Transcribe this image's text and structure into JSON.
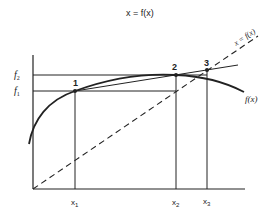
{
  "title": "x = f(x)",
  "labels": {
    "y_f2": "f",
    "y_f2_sub": "2",
    "y_f1": "f",
    "y_f1_sub": "1",
    "point1": "1",
    "point2": "2",
    "point3": "3",
    "curve": "f(x)",
    "diagonal": "x = f(x)",
    "x1": "x",
    "x1_sub": "1",
    "x2": "x",
    "x2_sub": "2",
    "x3": "x",
    "x3_sub": "3"
  },
  "colors": {
    "ink": "#222222",
    "background": "#ffffff"
  }
}
